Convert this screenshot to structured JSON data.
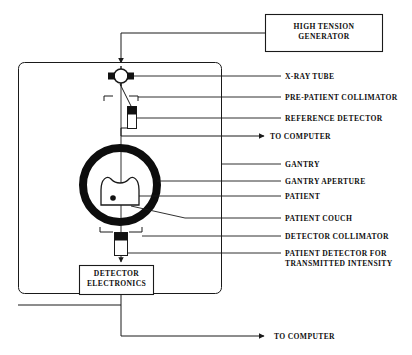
{
  "figure": {
    "type": "schematic-diagram",
    "background_color": "#ffffff",
    "line_color": "#1a1a1a",
    "text_color": "#101010"
  },
  "boxes": [
    {
      "id": "high-tension-generator",
      "label": "HIGH TENSION\nGENERATOR",
      "x": 265,
      "y": 14,
      "width": 118,
      "height": 38
    },
    {
      "id": "detector-electronics",
      "label": "DETECTOR\nELECTRONICS",
      "x": 79,
      "y": 265,
      "width": 75,
      "height": 30
    }
  ],
  "callout_labels": [
    {
      "id": "x-ray-tube",
      "text": "X-RAY TUBE",
      "x": 285,
      "y": 73
    },
    {
      "id": "pre-patient-collimator",
      "text": "PRE-PATIENT COLLIMATOR",
      "x": 285,
      "y": 94
    },
    {
      "id": "reference-detector",
      "text": "REFERENCE DETECTOR",
      "x": 285,
      "y": 115
    },
    {
      "id": "to-computer-upper",
      "text": "TO COMPUTER",
      "x": 272,
      "y": 134
    },
    {
      "id": "gantry",
      "text": "GANTRY",
      "x": 285,
      "y": 161
    },
    {
      "id": "gantry-aperture",
      "text": "GANTRY APERTURE",
      "x": 285,
      "y": 178
    },
    {
      "id": "patient",
      "text": "PATIENT",
      "x": 285,
      "y": 193
    },
    {
      "id": "patient-couch",
      "text": "PATIENT COUCH",
      "x": 285,
      "y": 215
    },
    {
      "id": "detector-collimator",
      "text": "DETECTOR COLLIMATOR",
      "x": 285,
      "y": 233
    },
    {
      "id": "patient-detector",
      "text": "PATIENT DETECTOR FOR\nTRANSMITTED INTENSITY",
      "x": 285,
      "y": 250
    },
    {
      "id": "to-computer-lower",
      "text": "TO COMPUTER",
      "x": 276,
      "y": 334
    }
  ],
  "components": {
    "gantry_frame": {
      "x": 18,
      "y": 62,
      "width": 204,
      "height": 232,
      "corner_radius": 6
    },
    "gantry_ring": {
      "cx": 120,
      "cy": 185,
      "outer_radius": 41,
      "ring_thickness": 8
    },
    "patient": {
      "cx": 120,
      "cy": 192,
      "width": 40,
      "height": 32
    },
    "isocenter_dot": {
      "cx": 113,
      "cy": 198,
      "radius": 2.6
    },
    "x_ray_tube": {
      "cx": 121,
      "cy": 76,
      "radius": 7
    },
    "reference_detector": {
      "x": 127,
      "y": 106,
      "width": 9,
      "height": 22
    },
    "detector_block": {
      "x": 115,
      "y": 232,
      "width": 12,
      "height": 23
    }
  }
}
